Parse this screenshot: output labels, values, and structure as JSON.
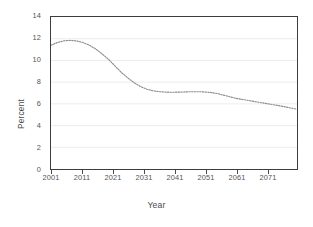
{
  "chart_data": {
    "type": "line",
    "title": "",
    "xlabel": "Year",
    "ylabel": "Percent",
    "xlim": [
      2001,
      2078
    ],
    "ylim": [
      0,
      14
    ],
    "grid": true,
    "grid_orientation": "horizontal",
    "legend": "none",
    "line_style": "dotted",
    "line_color": "#8c8c8c",
    "xticks": [
      2001,
      2011,
      2021,
      2031,
      2041,
      2051,
      2061,
      2071
    ],
    "xtick_labels": [
      "2001",
      "2011",
      "2021",
      "2031",
      "2041",
      "2051",
      "2061",
      "2071"
    ],
    "yticks": [
      0,
      2,
      4,
      6,
      8,
      10,
      12,
      14
    ],
    "ytick_labels": [
      "0",
      "2",
      "4",
      "6",
      "8",
      "10",
      "12",
      "14"
    ],
    "series": [
      {
        "name": "Percent",
        "x": [
          2001,
          2003,
          2005,
          2007,
          2009,
          2011,
          2013,
          2015,
          2017,
          2019,
          2021,
          2023,
          2025,
          2027,
          2029,
          2031,
          2033,
          2035,
          2037,
          2039,
          2041,
          2043,
          2045,
          2047,
          2049,
          2051,
          2053,
          2055,
          2057,
          2059,
          2061,
          2063,
          2065,
          2067,
          2069,
          2071,
          2073,
          2075,
          2078
        ],
        "values": [
          11.4,
          11.65,
          11.8,
          11.85,
          11.8,
          11.65,
          11.4,
          11.05,
          10.6,
          10.1,
          9.5,
          8.9,
          8.4,
          7.95,
          7.6,
          7.35,
          7.2,
          7.12,
          7.08,
          7.07,
          7.08,
          7.1,
          7.12,
          7.12,
          7.1,
          7.05,
          6.95,
          6.8,
          6.65,
          6.5,
          6.4,
          6.3,
          6.2,
          6.1,
          6.0,
          5.9,
          5.8,
          5.68,
          5.5
        ]
      }
    ]
  },
  "figure": {
    "name": "percent-by-year-line-chart"
  }
}
